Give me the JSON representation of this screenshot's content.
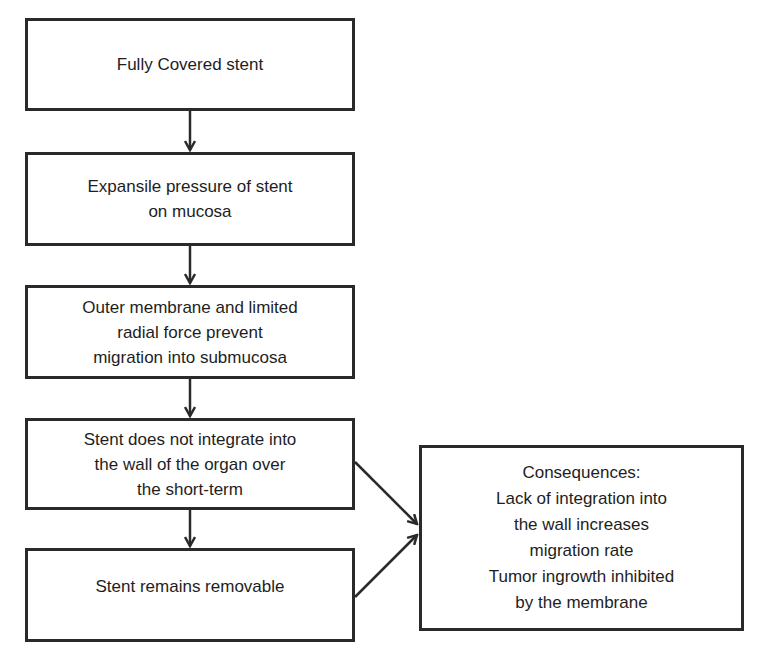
{
  "diagram": {
    "type": "flowchart",
    "nodes": [
      {
        "id": "fully-covered",
        "lines": [
          "Fully Covered stent"
        ]
      },
      {
        "id": "expansile-pressure",
        "lines": [
          "Expansile pressure of stent",
          "on mucosa"
        ]
      },
      {
        "id": "outer-membrane",
        "lines": [
          "Outer membrane and limited",
          "radial force prevent",
          "migration into submucosa"
        ]
      },
      {
        "id": "no-integration",
        "lines": [
          "Stent does not integrate into",
          "the wall of the organ over",
          "the short-term"
        ]
      },
      {
        "id": "removable",
        "lines": [
          "Stent remains removable"
        ]
      },
      {
        "id": "consequences",
        "lines": [
          "Consequences:",
          "Lack of integration into",
          "the wall increases",
          "migration rate",
          "Tumor ingrowth inhibited",
          "by the membrane"
        ]
      }
    ],
    "edges": [
      {
        "from": "fully-covered",
        "to": "expansile-pressure"
      },
      {
        "from": "expansile-pressure",
        "to": "outer-membrane"
      },
      {
        "from": "outer-membrane",
        "to": "no-integration"
      },
      {
        "from": "no-integration",
        "to": "removable"
      },
      {
        "from": "no-integration",
        "to": "consequences"
      },
      {
        "from": "removable",
        "to": "consequences"
      }
    ],
    "colors": {
      "stroke": "#2a2a2a",
      "text": "#1e1e1e",
      "background": "#ffffff"
    }
  }
}
